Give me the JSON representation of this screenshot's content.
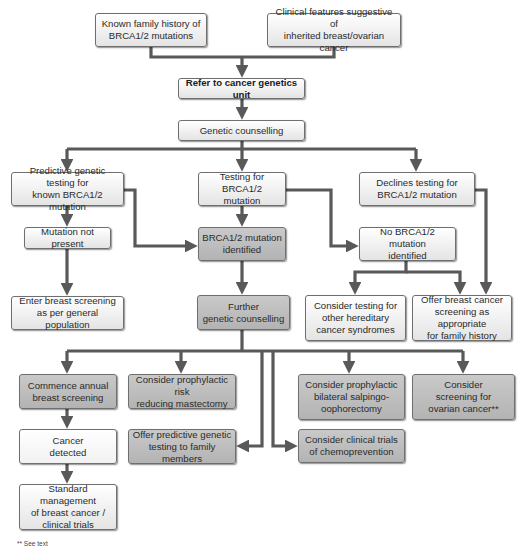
{
  "diagram": {
    "type": "flowchart",
    "colors": {
      "connector": "#595959",
      "box_light": "#eeeeee",
      "box_dark": "#bdbdbd",
      "border": "#6f6f6f"
    },
    "nodes": {
      "family_history": {
        "label": "Known family history of\nBRCA1/2 mutations",
        "style": "light"
      },
      "clinical_features": {
        "label": "Clinical features suggestive of\ninherited breast/ovarian cancer",
        "style": "light"
      },
      "refer": {
        "label": "Refer to cancer genetics unit",
        "style": "light-bold"
      },
      "counselling": {
        "label": "Genetic counselling",
        "style": "light"
      },
      "predictive_testing": {
        "label": "Predictive genetic testing for\nknown BRCA1/2 mutation",
        "style": "light"
      },
      "testing": {
        "label": "Testing for BRCA1/2\nmutation",
        "style": "light"
      },
      "declines": {
        "label": "Declines testing for\nBRCA1/2 mutation",
        "style": "light"
      },
      "not_present": {
        "label": "Mutation not present",
        "style": "light"
      },
      "identified": {
        "label": "BRCA1/2 mutation\nidentified",
        "style": "dark"
      },
      "no_mutation": {
        "label": "No BRCA1/2 mutation\nidentified",
        "style": "light"
      },
      "enter_screening": {
        "label": "Enter breast screening\nas per general population",
        "style": "light"
      },
      "further_counselling": {
        "label": "Further\ngenetic counselling",
        "style": "dark"
      },
      "other_syndromes": {
        "label": "Consider testing for\nother hereditary\ncancer syndromes",
        "style": "light"
      },
      "offer_screening": {
        "label": "Offer breast cancer\nscreening as appropriate\nfor family history",
        "style": "light"
      },
      "annual_screening": {
        "label": "Commence annual\nbreast screening",
        "style": "dark"
      },
      "mastectomy": {
        "label": "Consider prophylactic risk\nreducing mastectomy",
        "style": "dark"
      },
      "salpingo": {
        "label": "Consider prophylactic\nbilateral salpingo-\noophorectomy",
        "style": "dark"
      },
      "ovarian_screening": {
        "label": "Consider\nscreening for\novarian cancer**",
        "style": "dark"
      },
      "cancer_detected": {
        "label": "Cancer\ndetected",
        "style": "white"
      },
      "family_testing": {
        "label": "Offer predictive genetic\ntesting to family members",
        "style": "dark"
      },
      "chemoprevention": {
        "label": "Consider clinical trials\nof chemoprevention",
        "style": "dark"
      },
      "standard_management": {
        "label": "Standard management\nof breast cancer /\nclinical trials",
        "style": "light"
      }
    },
    "edges": [
      [
        "family_history",
        "refer"
      ],
      [
        "clinical_features",
        "refer"
      ],
      [
        "refer",
        "counselling"
      ],
      [
        "counselling",
        "predictive_testing"
      ],
      [
        "counselling",
        "testing"
      ],
      [
        "counselling",
        "declines"
      ],
      [
        "predictive_testing",
        "not_present"
      ],
      [
        "predictive_testing",
        "identified"
      ],
      [
        "testing",
        "identified"
      ],
      [
        "testing",
        "no_mutation"
      ],
      [
        "not_present",
        "enter_screening"
      ],
      [
        "identified",
        "further_counselling"
      ],
      [
        "no_mutation",
        "other_syndromes"
      ],
      [
        "no_mutation",
        "offer_screening"
      ],
      [
        "declines",
        "offer_screening"
      ],
      [
        "further_counselling",
        "annual_screening"
      ],
      [
        "further_counselling",
        "mastectomy"
      ],
      [
        "further_counselling",
        "family_testing"
      ],
      [
        "further_counselling",
        "chemoprevention"
      ],
      [
        "further_counselling",
        "salpingo"
      ],
      [
        "further_counselling",
        "ovarian_screening"
      ],
      [
        "annual_screening",
        "cancer_detected"
      ],
      [
        "cancer_detected",
        "standard_management"
      ]
    ],
    "footnote": "** See text"
  }
}
